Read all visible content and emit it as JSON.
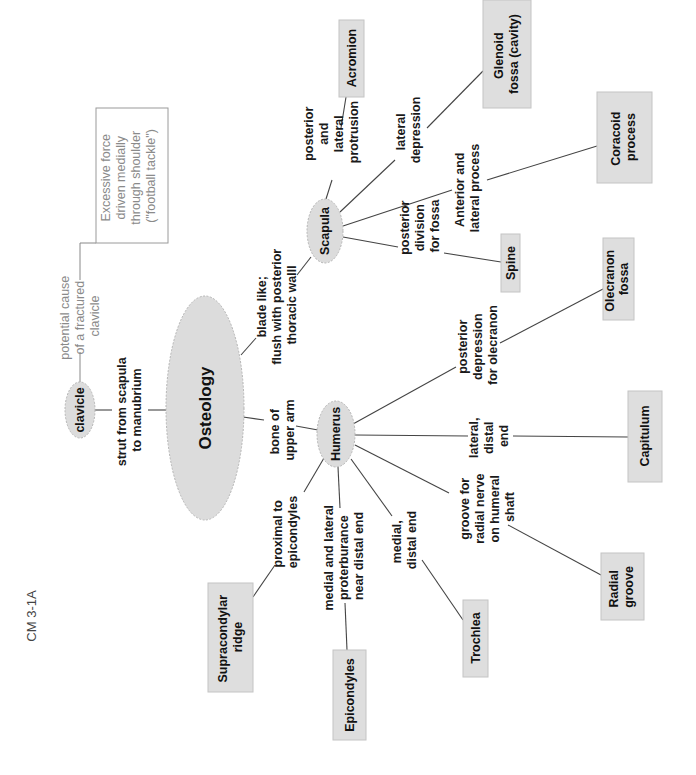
{
  "figure_label": "CM 3-1A",
  "orientation": "rotated 90 degrees counter-clockwise",
  "colors": {
    "node_fill": "#dcdcdc",
    "box_fill": "#dedede",
    "line": "#444444",
    "annotation_text": "#8a8a8a",
    "text": "#1a1a1a"
  },
  "central_node": {
    "label": "Osteology"
  },
  "nodes": {
    "clavicle": {
      "label": "clavicle"
    },
    "scapula": {
      "label": "Scapula"
    },
    "humerus": {
      "label": "Humerus"
    }
  },
  "annotation": {
    "link_lines": [
      "potential cause",
      "of a fractured",
      "clavicle"
    ],
    "box_lines": [
      "Excessive force",
      "driven medially",
      "through shoulder",
      "(\"football tackle\")"
    ]
  },
  "links": {
    "osteology_clavicle": [
      "strut from scapula",
      "to manubrium"
    ],
    "osteology_scapula": [
      "blade like;",
      "flush with posterior",
      "thoracic walll"
    ],
    "osteology_humerus": [
      "bone of",
      "upper arm"
    ]
  },
  "scapula_parts": [
    {
      "link": [
        "posterior",
        "and",
        "lateral",
        "protrusion"
      ],
      "target": [
        "Acromion"
      ]
    },
    {
      "link": [
        "lateral",
        "depression"
      ],
      "target": [
        "Glenoid",
        "fossa (cavity)"
      ]
    },
    {
      "link": [
        "Anterior and",
        "lateral process"
      ],
      "target": [
        "Coracoid",
        "process"
      ]
    },
    {
      "link": [
        "posterior",
        "division",
        "for fossa"
      ],
      "target": [
        "Spine"
      ]
    }
  ],
  "humerus_parts": [
    {
      "link": [
        "posterior",
        "depression",
        "for olecranon"
      ],
      "target": [
        "Olecranon",
        "fossa"
      ]
    },
    {
      "link": [
        "lateral,",
        "distal",
        "end"
      ],
      "target": [
        "Capitulum"
      ]
    },
    {
      "link": [
        "groove for",
        "radial nerve",
        "on humeral",
        "shaft"
      ],
      "target": [
        "Radial",
        "groove"
      ]
    },
    {
      "link": [
        "medial,",
        "distal end"
      ],
      "target": [
        "Trochlea"
      ]
    },
    {
      "link": [
        "medial and lateral",
        "proterburance",
        "near distal end"
      ],
      "target": [
        "Epicondyles"
      ]
    },
    {
      "link": [
        "proximal to",
        "epicondyles"
      ],
      "target": [
        "Supracondylar",
        "ridge"
      ]
    }
  ]
}
